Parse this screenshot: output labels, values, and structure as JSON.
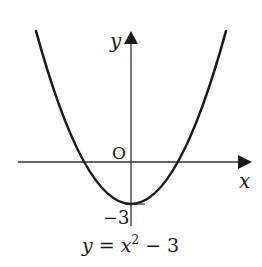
{
  "diagram": {
    "type": "function-graph",
    "axes": {
      "x_label": "x",
      "y_label": "y",
      "origin_label": "O",
      "y_intercept_label": "−3"
    },
    "curve": {
      "equation_label": "y = x² − 3",
      "eq_y": "y",
      "eq_eq": " = ",
      "eq_x": "x",
      "eq_exp": "2",
      "eq_rest": " − 3",
      "vertex": [
        0,
        -3
      ],
      "shape": "upward parabola"
    },
    "colors": {
      "curve": "#1a1a1a",
      "axes": "#333333",
      "background": "#ffffff"
    }
  }
}
